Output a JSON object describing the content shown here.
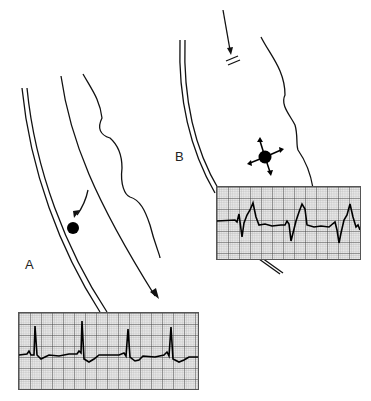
{
  "figure": {
    "panels": [
      {
        "id": "A",
        "label": "A",
        "description": "Impulse traveling down conduction pathway; normal sinus rhythm ECG",
        "ecg": {
          "rhythm": "narrow-complex QRS, regular",
          "beats": 4
        }
      },
      {
        "id": "B",
        "label": "B",
        "description": "Blocked conduction with ectopic focus radiating impulses; wide-complex ectopic ECG",
        "ecg": {
          "rhythm": "wide-complex QRS, regular",
          "beats": 3
        }
      }
    ],
    "icons": {
      "impulse-dot": "filled circle",
      "ectopic-focus": "filled circle with four radiating arrows",
      "block-marker": "double hash lines"
    }
  }
}
